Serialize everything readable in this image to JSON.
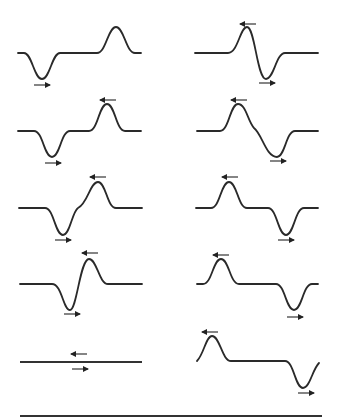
{
  "colors": {
    "stroke": "#2a2a2a",
    "background": "#ffffff"
  },
  "panels": [
    {
      "id": "r1-left",
      "sequence": 1,
      "description": "Trough on left moving right, crest on right moving left, far apart"
    },
    {
      "id": "r2-left",
      "sequence": 2,
      "description": "Pulses approaching each other"
    },
    {
      "id": "r3-left",
      "sequence": 3,
      "description": "Pulses beginning to overlap"
    },
    {
      "id": "r4-left",
      "sequence": 4,
      "description": "Pulses overlapping strongly"
    },
    {
      "id": "r5-left",
      "sequence": 5,
      "description": "Complete destructive interference: flat line"
    },
    {
      "id": "r1-right",
      "sequence": 6,
      "description": "Pulses passing through each other"
    },
    {
      "id": "r2-right",
      "sequence": 7,
      "description": "Crest moving left, trough moving right, separating"
    },
    {
      "id": "r3-right",
      "sequence": 8,
      "description": "Pulses further separated"
    },
    {
      "id": "r4-right",
      "sequence": 9,
      "description": "Pulses further separated"
    },
    {
      "id": "r5-right",
      "sequence": 10,
      "description": "Pulses widely separated, crest at left, trough at right"
    }
  ],
  "arrows": {
    "left_direction": "←",
    "right_direction": "→"
  }
}
